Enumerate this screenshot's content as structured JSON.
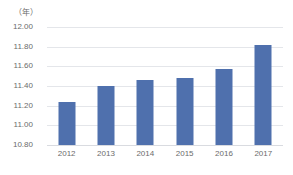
{
  "chart_data": {
    "type": "bar",
    "title": "",
    "subtitle": "",
    "xlabel": "（年）",
    "ylabel": "（年）",
    "categories": [
      "2012",
      "2013",
      "2014",
      "2015",
      "2016",
      "2017"
    ],
    "values": [
      11.24,
      11.4,
      11.46,
      11.48,
      11.57,
      11.82
    ],
    "series": [
      {
        "name": "",
        "values": [
          11.24,
          11.4,
          11.46,
          11.48,
          11.57,
          11.82
        ]
      }
    ],
    "ylim": [
      10.8,
      12.0
    ],
    "ytick_labels": [
      "12.00",
      "11.80",
      "11.60",
      "11.40",
      "11.20",
      "11.00",
      "10.80"
    ],
    "ytick_values": [
      12.0,
      11.8,
      11.6,
      11.4,
      11.2,
      11.0,
      10.8
    ],
    "grid": true,
    "legend": "none",
    "bar_color": "#4f70ad",
    "grid_color": "#e4e6ea",
    "background_color": "#ffffff",
    "axis_text_color": "#6b6b6b"
  }
}
